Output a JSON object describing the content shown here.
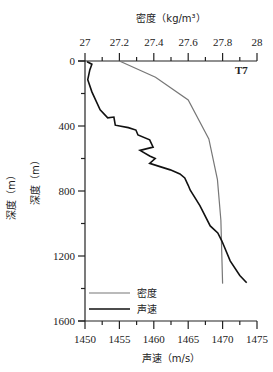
{
  "chart_data": {
    "type": "line",
    "title": "",
    "label_t7": "T7",
    "top_axis": {
      "label": "密度（kg/m³）",
      "ticks": [
        "27",
        "27.2",
        "27.4",
        "27.6",
        "27.8",
        "28"
      ],
      "range": [
        27,
        28
      ]
    },
    "bottom_axis": {
      "label": "声速（m/s）",
      "ticks": [
        "1450",
        "1455",
        "1460",
        "1465",
        "1470",
        "1475"
      ],
      "range": [
        1450,
        1475
      ]
    },
    "y_axis": {
      "label1": "深度（m）",
      "label2": "深度（m）",
      "ticks": [
        "0",
        "400",
        "800",
        "1200",
        "1600"
      ],
      "range": [
        0,
        1600
      ],
      "inverted": true
    },
    "legend": [
      {
        "name": "密度",
        "color": "#777777"
      },
      {
        "name": "声速",
        "color": "#111111"
      }
    ],
    "series": [
      {
        "name": "密度",
        "axis": "top",
        "points": [
          [
            27.2,
            0
          ],
          [
            27.41,
            100
          ],
          [
            27.6,
            240
          ],
          [
            27.72,
            480
          ],
          [
            27.77,
            730
          ],
          [
            27.79,
            980
          ],
          [
            27.8,
            1370
          ]
        ]
      },
      {
        "name": "声速",
        "axis": "bottom",
        "points": [
          [
            1450.3,
            5
          ],
          [
            1451.0,
            20
          ],
          [
            1450.7,
            55
          ],
          [
            1450.4,
            115
          ],
          [
            1451.0,
            190
          ],
          [
            1452.2,
            300
          ],
          [
            1453.3,
            350
          ],
          [
            1454.2,
            345
          ],
          [
            1454.4,
            395
          ],
          [
            1456.3,
            410
          ],
          [
            1457.4,
            425
          ],
          [
            1457.7,
            455
          ],
          [
            1459.4,
            485
          ],
          [
            1459.9,
            530
          ],
          [
            1458.0,
            550
          ],
          [
            1459.4,
            585
          ],
          [
            1460.2,
            600
          ],
          [
            1459.4,
            630
          ],
          [
            1460.9,
            650
          ],
          [
            1462.4,
            670
          ],
          [
            1463.8,
            695
          ],
          [
            1464.5,
            720
          ],
          [
            1465.0,
            765
          ],
          [
            1465.3,
            795
          ],
          [
            1466.7,
            890
          ],
          [
            1468.2,
            1015
          ],
          [
            1469.3,
            1058
          ],
          [
            1469.9,
            1108
          ],
          [
            1471.1,
            1230
          ],
          [
            1472.5,
            1320
          ],
          [
            1473.5,
            1365
          ]
        ]
      }
    ]
  }
}
